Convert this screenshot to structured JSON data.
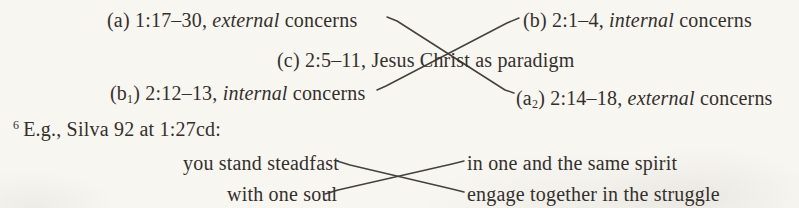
{
  "page": {
    "background": "#f8f6f1",
    "ink": "#33302c",
    "line_color": "#45423d"
  },
  "outline": {
    "nodes": [
      {
        "id": "a",
        "open": "(a",
        "sub": "",
        "ref": ") 1:17–30, ",
        "em": "external",
        "tail": " concerns"
      },
      {
        "id": "b",
        "open": "(b",
        "sub": "",
        "ref": ") 2:1–4, ",
        "em": "internal",
        "tail": " concerns"
      },
      {
        "id": "c",
        "open": "(c",
        "sub": "",
        "ref": ") 2:5–11, Jesus Christ as paradigm",
        "em": "",
        "tail": ""
      },
      {
        "id": "b1",
        "open": "(b",
        "sub": "1",
        "ref": ") 2:12–13, ",
        "em": "internal",
        "tail": " concerns"
      },
      {
        "id": "a2",
        "open": "(a",
        "sub": "2",
        "ref": ") 2:14–18, ",
        "em": "external",
        "tail": " concerns"
      }
    ]
  },
  "footnote": {
    "marker": "6",
    "text": "E.g., Silva 92 at 1:27cd:"
  },
  "quote_chiasm": {
    "left": [
      "you stand steadfast",
      "with one soul"
    ],
    "right": [
      "in one and the same spirit",
      "engage together in the struggle"
    ]
  }
}
